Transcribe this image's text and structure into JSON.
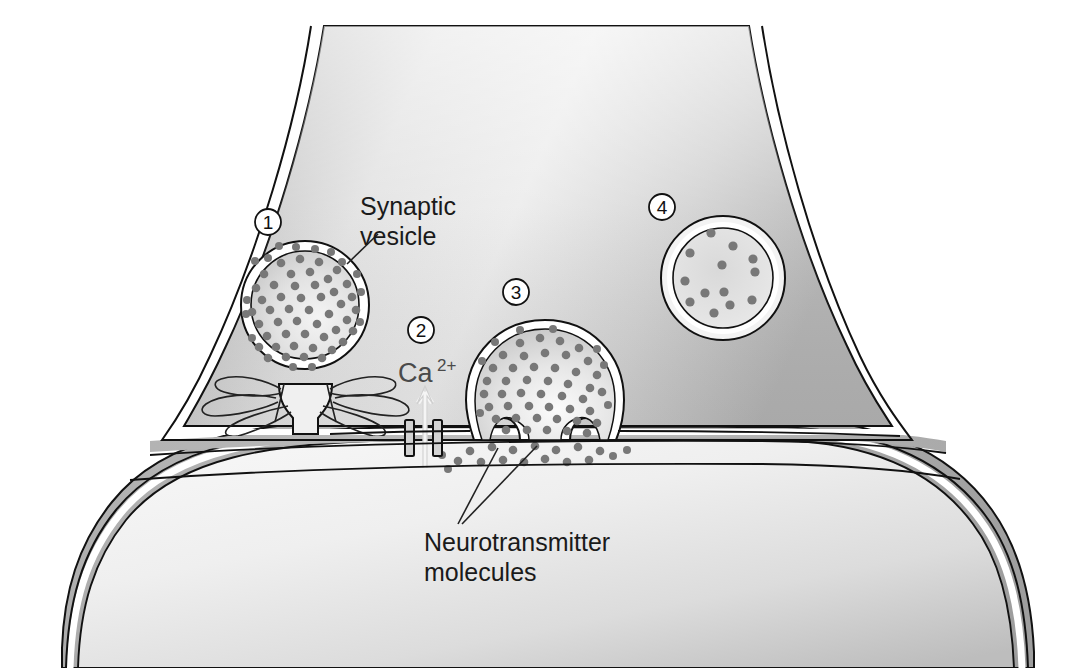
{
  "figure": {
    "type": "biological-diagram",
    "background_color": "#ffffff"
  },
  "labels": {
    "synaptic_vesicle_line1": "Synaptic",
    "synaptic_vesicle_line2": "vesicle",
    "calcium_ion": "Ca",
    "calcium_ion_superscript": "2+",
    "neurotransmitter_line1": "Neurotransmitter",
    "neurotransmitter_line2": "molecules"
  },
  "step_markers": [
    {
      "number": "1",
      "cx": 268,
      "cy": 222,
      "describes": "synaptic-vesicle-filled"
    },
    {
      "number": "2",
      "cx": 421,
      "cy": 330,
      "describes": "calcium-channel-influx"
    },
    {
      "number": "3",
      "cx": 516,
      "cy": 292,
      "describes": "vesicle-fusion-exocytosis"
    },
    {
      "number": "4",
      "cx": 662,
      "cy": 207,
      "describes": "recycled-empty-vesicle"
    }
  ],
  "structures": {
    "presynaptic_terminal": "presynaptic-axon-terminal",
    "postsynaptic_cell": "postsynaptic-cell",
    "synaptic_cleft": "synaptic-cleft",
    "calcium_channel": "voltage-gated-calcium-channel",
    "docked_vesicle": "docked-synaptic-vesicle",
    "fusing_vesicle": "fusing-synaptic-vesicle",
    "recycled_vesicle": "empty-recycled-vesicle",
    "snare_proteins": "snare-protein-complex",
    "transmitter_dots": "neurotransmitter-molecule-dots"
  },
  "colors": {
    "terminal_fill_light": "#e9e9e9",
    "terminal_fill_mid": "#c2c2c2",
    "terminal_fill_dark": "#a9a9a9",
    "postsynaptic_fill": "#f2f2f2",
    "cleft_fill": "#b9b9b9",
    "outline": "#111111",
    "membrane_white": "#ffffff",
    "vesicle_dot": "#787878",
    "text": "#1a1a1a",
    "ion_text": "#4a4a4a"
  },
  "counts": {
    "docked_vesicle_dots": 78,
    "fusing_vesicle_dots": 66,
    "recycled_vesicle_dots": 13,
    "released_cleft_dots": 24
  }
}
